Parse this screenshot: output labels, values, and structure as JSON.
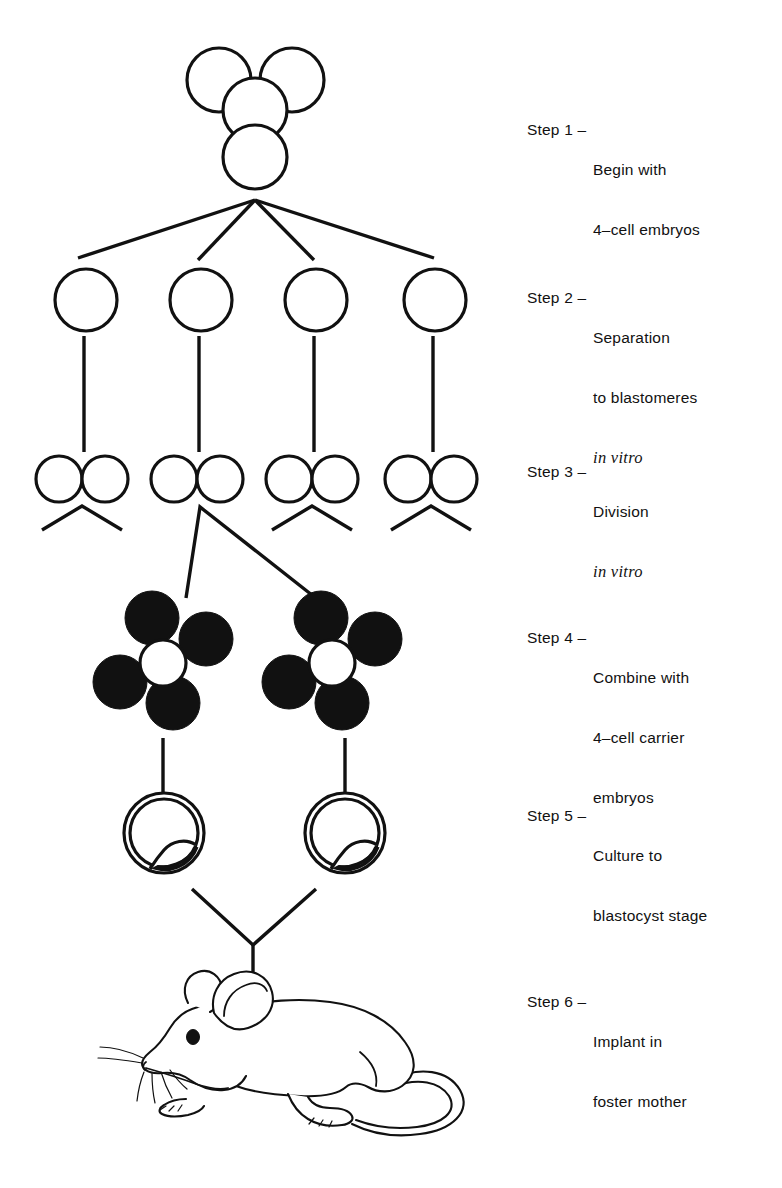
{
  "figure": {
    "ink_color": "#111111",
    "background_color": "#ffffff"
  },
  "steps": [
    {
      "key": "Step 1 –",
      "lines": [
        "Begin with",
        "4–cell embryos"
      ],
      "italic_lines": [],
      "top": 120,
      "stage": "four-cell-embryo"
    },
    {
      "key": "Step 2 –",
      "lines": [
        "Separation",
        "to blastomeres"
      ],
      "italic_lines": [
        "in vitro"
      ],
      "top": 288,
      "stage": "separated-blastomeres"
    },
    {
      "key": "Step 3 –",
      "lines": [
        "Division"
      ],
      "italic_lines": [
        "in vitro"
      ],
      "top": 462,
      "stage": "divided-blastomeres"
    },
    {
      "key": "Step 4 –",
      "lines": [
        "Combine with",
        "4–cell carrier",
        "embryos"
      ],
      "italic_lines": [],
      "top": 628,
      "stage": "carrier-embryo-combination"
    },
    {
      "key": "Step 5 –",
      "lines": [
        "Culture to",
        "blastocyst stage"
      ],
      "italic_lines": [],
      "top": 806,
      "stage": "blastocyst"
    },
    {
      "key": "Step 6 –",
      "lines": [
        "Implant in",
        "foster mother"
      ],
      "italic_lines": [],
      "top": 992,
      "stage": "foster-mother-mouse"
    }
  ],
  "diagram": {
    "step1": {
      "label": "4-cell embryo, four overlapping open circles",
      "circle_radius": 32,
      "circles": [
        {
          "name": "cell-upper-left",
          "cx": 219,
          "cy": 80
        },
        {
          "name": "cell-upper-right",
          "cx": 292,
          "cy": 80
        },
        {
          "name": "cell-middle",
          "cx": 255,
          "cy": 110
        },
        {
          "name": "cell-lower",
          "cx": 255,
          "cy": 157
        }
      ]
    },
    "step2": {
      "label": "Four separated blastomeres",
      "circle_radius": 31,
      "fan_origin": {
        "x": 255,
        "cy": 199
      },
      "circles": [
        {
          "name": "blastomere-1",
          "cx": 86,
          "cy": 300
        },
        {
          "name": "blastomere-2",
          "cx": 201,
          "cy": 300
        },
        {
          "name": "blastomere-3",
          "cx": 316,
          "cy": 300
        },
        {
          "name": "blastomere-4",
          "cx": 435,
          "cy": 300
        }
      ]
    },
    "step3": {
      "label": "Four divided blastomere pairs",
      "circle_radius": 23,
      "pairs": [
        {
          "name": "pair-1",
          "left_cx": 59,
          "right_cx": 105,
          "cy": 479
        },
        {
          "name": "pair-2",
          "left_cx": 174,
          "right_cx": 220,
          "cy": 479
        },
        {
          "name": "pair-3",
          "left_cx": 289,
          "right_cx": 335,
          "cy": 479
        },
        {
          "name": "pair-4",
          "left_cx": 408,
          "right_cx": 454,
          "cy": 479
        }
      ]
    },
    "step4": {
      "label": "Two carrier embryo clusters, black donor cells around white host cell",
      "filled_radius": 27,
      "host_radius": 23,
      "clusters": [
        {
          "name": "carrier-cluster-left",
          "host": {
            "cx": 163,
            "cy": 663
          },
          "filled": [
            {
              "cx": 152,
              "cy": 618
            },
            {
              "cx": 206,
              "cy": 639
            },
            {
              "cx": 120,
              "cy": 682
            },
            {
              "cx": 173,
              "cy": 703
            }
          ]
        },
        {
          "name": "carrier-cluster-right",
          "host": {
            "cx": 332,
            "cy": 663
          },
          "filled": [
            {
              "cx": 321,
              "cy": 618
            },
            {
              "cx": 375,
              "cy": 639
            },
            {
              "cx": 289,
              "cy": 682
            },
            {
              "cx": 342,
              "cy": 703
            }
          ]
        }
      ]
    },
    "step5": {
      "label": "Two blastocysts with inner cell mass",
      "outer_radius": 40,
      "inner_radius": 34,
      "blastocysts": [
        {
          "name": "blastocyst-left",
          "cx": 164,
          "cy": 833
        },
        {
          "name": "blastocyst-right",
          "cx": 345,
          "cy": 833
        }
      ],
      "junction": {
        "x": 253,
        "y": 945
      }
    },
    "step6": {
      "label": "Foster mother mouse, side view facing left",
      "anchor": {
        "x": 253,
        "y": 1000
      }
    }
  }
}
